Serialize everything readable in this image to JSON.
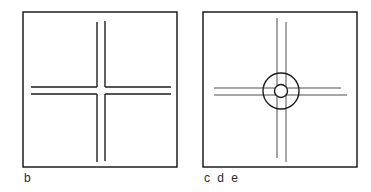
{
  "panels": [
    {
      "id": "b",
      "label": "b",
      "description": "Square frame with an open cross formed by two parallel vertical lines and two parallel horizontal lines, broken at the intersection",
      "frame": {
        "x": 23,
        "y": 12,
        "width": 154,
        "height": 155
      },
      "vertical_lines": [
        {
          "x": 97,
          "y1": 22,
          "y2": 162
        },
        {
          "x": 105,
          "y1": 21,
          "y2": 161
        }
      ],
      "horizontal_lines": [
        {
          "y": 87,
          "x1": 31,
          "x2": 171
        },
        {
          "y": 94,
          "x1": 31,
          "x2": 171
        }
      ],
      "gap": {
        "x1": 97,
        "x2": 105,
        "y1": 87,
        "y2": 94
      }
    },
    {
      "id": "cde",
      "label": "c d e",
      "description": "Square frame with thin crossing double lines and two concentric circles at the intersection",
      "frame": {
        "x": 203,
        "y": 12,
        "width": 154,
        "height": 155
      },
      "vertical_lines": [
        {
          "x": 277,
          "y1": 18,
          "y2": 158
        },
        {
          "x": 286,
          "y1": 22,
          "y2": 162
        }
      ],
      "horizontal_lines": [
        {
          "y": 88,
          "x1": 214,
          "x2": 341
        },
        {
          "y": 95,
          "x1": 214,
          "x2": 347
        }
      ],
      "circles": [
        {
          "cx": 281,
          "cy": 91,
          "r": 18
        },
        {
          "cx": 281,
          "cy": 91,
          "r": 6.5
        }
      ]
    }
  ],
  "colors": {
    "stroke": "#1e1e1e",
    "thin_stroke": "#3a3a3a",
    "background": "#ffffff"
  }
}
